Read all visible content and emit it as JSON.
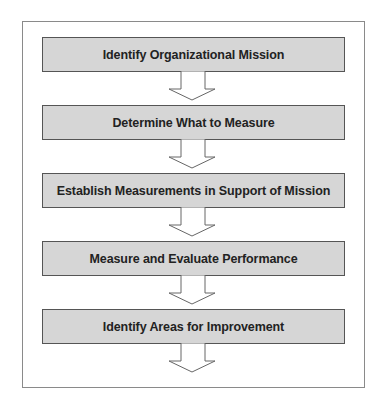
{
  "diagram": {
    "type": "vertical-flowchart",
    "steps": [
      {
        "label": "Identify Organizational Mission"
      },
      {
        "label": "Determine What to Measure"
      },
      {
        "label": "Establish Measurements in Support of Mission"
      },
      {
        "label": "Measure and Evaluate Performance"
      },
      {
        "label": "Identify Areas for Improvement"
      }
    ],
    "colors": {
      "step_fill": "#d6d6d6",
      "step_border": "#555555",
      "frame_border": "#8a8a8a",
      "text": "#222222"
    }
  }
}
